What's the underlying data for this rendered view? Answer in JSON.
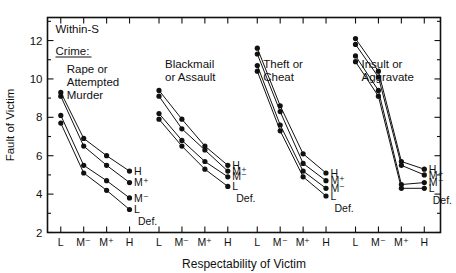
{
  "figure": {
    "condition_label": "Within-S",
    "legend_heading": "Crime:",
    "legend_heading_underlined": true,
    "defendant_label": "Def.",
    "ink_color": "#111111",
    "background_color": "#ffffff"
  },
  "axes": {
    "ylabel": "Fault of Victim",
    "xlabel": "Respectability of Victim",
    "y_ticks_major": [
      2,
      4,
      6,
      8,
      10,
      12
    ],
    "y_tick_labels": [
      "2",
      "4",
      "6",
      "8",
      "10",
      "12"
    ],
    "y_minor_between": true,
    "ylim": [
      2,
      13.2
    ],
    "x_tick_labels": [
      "L",
      "M⁻",
      "M⁺",
      "H"
    ],
    "grid": false,
    "top_ticks": true,
    "right_ticks": true
  },
  "series_labels": [
    "H",
    "M⁺",
    "M⁻",
    "L"
  ],
  "chart_data": {
    "type": "line",
    "title": "Within-S",
    "xlabel": "Respectability of Victim",
    "ylabel": "Fault of Victim",
    "ylim": [
      2,
      13.2
    ],
    "categories": [
      "L",
      "M⁻",
      "M⁺",
      "H"
    ],
    "legend_position": "inline-right-of-each-panel",
    "legend_title": "Crime:",
    "series_group_label": "Def.",
    "panels": [
      {
        "name": "Rape or Attempted Murder",
        "title_lines": [
          "Rape or",
          "Attempted",
          "Murder"
        ],
        "series": [
          {
            "name": "H",
            "values": [
              9.3,
              6.9,
              6.0,
              5.2
            ]
          },
          {
            "name": "M⁺",
            "values": [
              9.1,
              6.5,
              5.5,
              4.6
            ]
          },
          {
            "name": "M⁻",
            "values": [
              8.1,
              5.5,
              4.7,
              3.8
            ]
          },
          {
            "name": "L",
            "values": [
              7.7,
              5.1,
              4.2,
              3.2
            ]
          }
        ]
      },
      {
        "name": "Blackmail or Assault",
        "title_lines": [
          "Blackmail",
          "or Assault"
        ],
        "series": [
          {
            "name": "H",
            "values": [
              9.4,
              7.9,
              6.5,
              5.5
            ]
          },
          {
            "name": "M⁺",
            "values": [
              9.1,
              7.4,
              6.3,
              5.2
            ]
          },
          {
            "name": "M⁻",
            "values": [
              8.2,
              6.8,
              5.7,
              4.9
            ]
          },
          {
            "name": "L",
            "values": [
              7.9,
              6.5,
              5.3,
              4.4
            ]
          }
        ]
      },
      {
        "name": "Theft or Cheat",
        "title_lines": [
          "Theft or",
          "Cheat"
        ],
        "series": [
          {
            "name": "H",
            "values": [
              11.6,
              8.6,
              6.1,
              5.1
            ]
          },
          {
            "name": "M⁺",
            "values": [
              11.3,
              8.3,
              5.6,
              4.7
            ]
          },
          {
            "name": "M⁻",
            "values": [
              10.7,
              7.6,
              5.2,
              4.3
            ]
          },
          {
            "name": "L",
            "values": [
              10.4,
              7.3,
              4.9,
              3.9
            ]
          }
        ]
      },
      {
        "name": "Insult or Aggravate",
        "title_lines": [
          "Insult or",
          "Aggravate"
        ],
        "series": [
          {
            "name": "H",
            "values": [
              12.1,
              10.4,
              5.7,
              5.3
            ]
          },
          {
            "name": "M⁺",
            "values": [
              11.8,
              10.1,
              5.5,
              5.0
            ]
          },
          {
            "name": "M⁻",
            "values": [
              11.2,
              9.4,
              4.5,
              4.6
            ]
          },
          {
            "name": "L",
            "values": [
              10.9,
              9.1,
              4.3,
              4.3
            ]
          }
        ]
      }
    ]
  }
}
